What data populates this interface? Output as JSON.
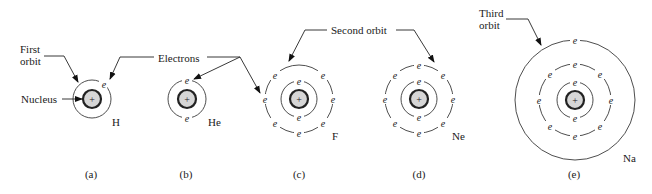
{
  "figure": {
    "callouts": {
      "first_orbit": "First\norbit",
      "first_orbit_line1": "First",
      "first_orbit_line2": "orbit",
      "nucleus": "Nucleus",
      "electrons": "Electrons",
      "second_orbit": "Second orbit",
      "third_orbit_line1": "Third",
      "third_orbit_line2": "orbit"
    },
    "electron_symbol": "e",
    "nucleus_symbol": "+",
    "atoms": [
      {
        "id": "a",
        "caption": "(a)",
        "element": "H",
        "shells": [
          1
        ],
        "cx": 92,
        "cy": 99
      },
      {
        "id": "b",
        "caption": "(b)",
        "element": "He",
        "shells": [
          2
        ],
        "cx": 187,
        "cy": 99
      },
      {
        "id": "c",
        "caption": "(c)",
        "element": "F",
        "shells": [
          2,
          7
        ],
        "cx": 299,
        "cy": 99
      },
      {
        "id": "d",
        "caption": "(d)",
        "element": "Ne",
        "shells": [
          2,
          8
        ],
        "cx": 419,
        "cy": 99
      },
      {
        "id": "e",
        "caption": "(e)",
        "element": "Na",
        "shells": [
          2,
          8,
          1
        ],
        "cx": 575,
        "cy": 100
      }
    ]
  }
}
